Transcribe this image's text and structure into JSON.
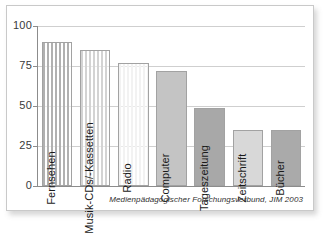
{
  "chart_data": {
    "type": "bar",
    "title": "",
    "subtitle": "",
    "xlabel": "",
    "ylabel": "",
    "ylim": [
      0,
      100
    ],
    "yticks": [
      "0",
      "25",
      "50",
      "75",
      "100"
    ],
    "grid": true,
    "legend": null,
    "categories": [
      "Fernsehen",
      "Musik-CDs/-Kassetten",
      "Radio",
      "Computer",
      "Tageszeitung",
      "Zeitschrift",
      "Bücher"
    ],
    "values": [
      90,
      85,
      77,
      72,
      49,
      35,
      35
    ],
    "bar_colors": [
      "#b0b0b0",
      "#d3d3d3",
      "#f2f2f2",
      "#c4c4c4",
      "#a8a8a8",
      "#d8d8d8",
      "#aaaaaa"
    ],
    "bar_patterns": [
      "vertical-stripes",
      "vertical-stripes",
      "vertical-stripes",
      "solid",
      "solid",
      "solid",
      "solid"
    ],
    "annotation": "Medienpädagogischer Forschungsverbund, JIM 2003"
  },
  "figure": {
    "source_note": "Medienpädagogischer Forschungsverbund, JIM 2003"
  }
}
